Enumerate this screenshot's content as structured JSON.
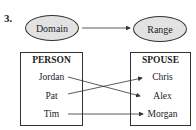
{
  "problem_number": "3.",
  "top": {
    "domain_label": "Domain",
    "range_label": "Range"
  },
  "left_set": {
    "title": "PERSON",
    "items": [
      "Jordan",
      "Pat",
      "Tim"
    ]
  },
  "right_set": {
    "title": "SPOUSE",
    "items": [
      "Chris",
      "Alex",
      "Morgan"
    ]
  },
  "mappings": [
    {
      "from": "Jordan",
      "to": "Alex"
    },
    {
      "from": "Pat",
      "to": "Chris"
    },
    {
      "from": "Tim",
      "to": "Morgan"
    }
  ],
  "colors": {
    "ellipse_fill": "#e2e2e2",
    "stroke": "#333333"
  }
}
